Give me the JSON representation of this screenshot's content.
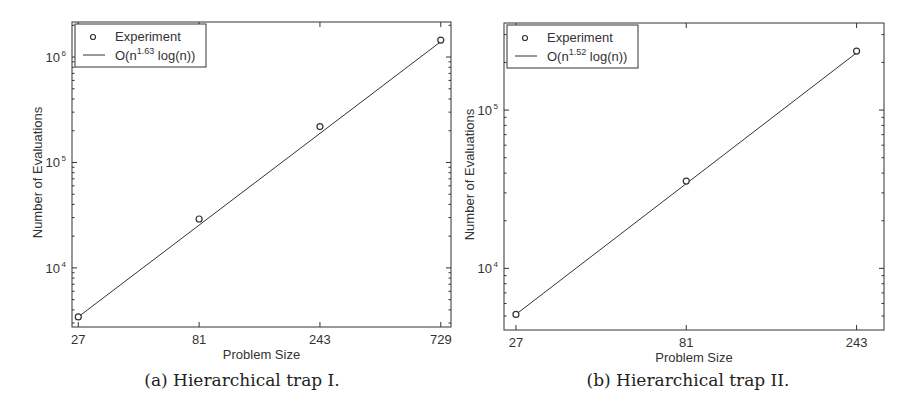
{
  "chart_data": [
    {
      "type": "line",
      "title": "",
      "caption": "(a) Hierarchical trap I.",
      "xlabel": "Problem Size",
      "ylabel": "Number of Evaluations",
      "xscale": "log",
      "yscale": "log",
      "x_ticks": [
        27,
        81,
        243,
        729
      ],
      "y_ticks": [
        {
          "value": 10000,
          "label": "10",
          "exp": "4"
        },
        {
          "value": 100000,
          "label": "10",
          "exp": "5"
        },
        {
          "value": 1000000,
          "label": "10",
          "exp": "6"
        }
      ],
      "xlim": [
        25.5,
        800
      ],
      "ylim": [
        2750,
        2150000
      ],
      "grid": false,
      "legend_position": "upper left",
      "series": [
        {
          "name": "Experiment",
          "style": "markers-circle",
          "x": [
            27,
            81,
            243,
            729
          ],
          "y": [
            3430,
            29100,
            219000,
            1450000
          ]
        },
        {
          "name": "O(n^1.63 log(n))",
          "legend_base": "O(n",
          "legend_sup": "1.63",
          "legend_tail": " log(n))",
          "style": "line",
          "x": [
            27,
            729
          ],
          "y": [
            3430,
            1400000
          ]
        }
      ],
      "box": {
        "x0": 72,
        "x1": 451,
        "y0": 22,
        "y1": 327
      }
    },
    {
      "type": "line",
      "title": "",
      "caption": "(b) Hierarchical trap II.",
      "xlabel": "Problem Size",
      "ylabel": "Number of Evaluations",
      "xscale": "log",
      "yscale": "log",
      "x_ticks": [
        27,
        81,
        243
      ],
      "y_ticks": [
        {
          "value": 10000,
          "label": "10",
          "exp": "4"
        },
        {
          "value": 100000,
          "label": "10",
          "exp": "5"
        }
      ],
      "xlim": [
        25,
        290
      ],
      "ylim": [
        4080,
        355000
      ],
      "grid": false,
      "legend_position": "upper left",
      "series": [
        {
          "name": "Experiment",
          "style": "markers-circle",
          "x": [
            27,
            81,
            243
          ],
          "y": [
            5120,
            35600,
            236000
          ]
        },
        {
          "name": "O(n^1.52 log(n))",
          "legend_base": "O(n",
          "legend_sup": "1.52",
          "legend_tail": " log(n))",
          "style": "line",
          "x": [
            27,
            243
          ],
          "y": [
            5120,
            230000
          ]
        }
      ],
      "box": {
        "x0": 504,
        "x1": 884,
        "y0": 23,
        "y1": 330
      }
    }
  ],
  "captions": {
    "a": "(a) Hierarchical trap I.",
    "b": "(b) Hierarchical trap II."
  }
}
